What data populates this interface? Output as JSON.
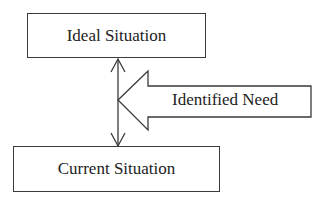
{
  "diagram": {
    "nodes": [
      {
        "id": "ideal",
        "label": "Ideal Situation"
      },
      {
        "id": "current",
        "label": "Current Situation"
      }
    ],
    "gap_arrow": {
      "label": "Identified Need",
      "direction": "left",
      "points_to": "gap between Ideal Situation and Current Situation"
    },
    "connector": {
      "type": "double-headed-arrow",
      "from": "Ideal Situation",
      "to": "Current Situation"
    },
    "colors": {
      "stroke": "#3a3a3a",
      "text": "#222222",
      "background": "#ffffff"
    }
  }
}
